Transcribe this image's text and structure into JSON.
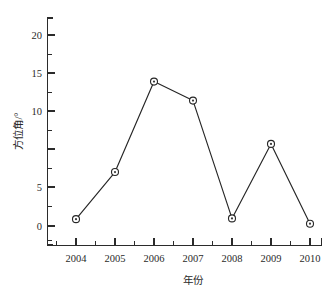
{
  "chart_data": {
    "type": "line",
    "title": "",
    "xlabel": "年份",
    "ylabel": "方位角/°",
    "categories": [
      "2004",
      "2005",
      "2006",
      "2007",
      "2008",
      "2009",
      "2010"
    ],
    "x": [
      2004,
      2005,
      2006,
      2007,
      2008,
      2009,
      2010
    ],
    "values": [
      0.9,
      7.1,
      19.0,
      16.5,
      1.0,
      10.8,
      0.3
    ],
    "series": [
      {
        "name": "方位角",
        "values": [
          0.9,
          7.1,
          19.0,
          16.5,
          1.0,
          10.8,
          0.3
        ]
      }
    ],
    "xlim": [
      2003.5,
      2010.5
    ],
    "ylim": [
      -1.6,
      21.5
    ],
    "ytick_labels": [
      "0",
      "5",
      "10",
      "15",
      "20"
    ],
    "yticks": [
      0,
      5,
      10,
      15,
      20
    ],
    "yticks_minor": [
      2.5,
      7.5,
      12.5,
      17.5
    ],
    "xticks_minor": [
      2004.5,
      2005.5,
      2006.5,
      2007.5,
      2008.5,
      2009.5
    ],
    "grid": false,
    "legend": false,
    "legend_position": "none",
    "marker": "open-circle",
    "line_color": "#262626",
    "marker_face_color": "#ffffff",
    "marker_edge_color": "#262626"
  },
  "axes": {
    "y_axis_label": "方位角/°",
    "x_axis_label": "年份"
  },
  "colors": {
    "background": "#ffffff",
    "foreground": "#262626",
    "accent": "#3a3a3a"
  }
}
